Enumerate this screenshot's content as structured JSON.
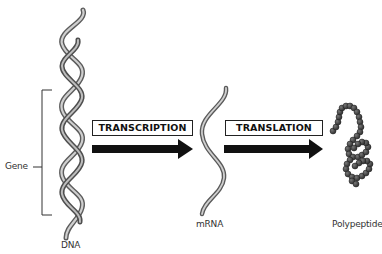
{
  "diagram": {
    "nodes": [
      {
        "id": "dna",
        "label": "DNA"
      },
      {
        "id": "mrna",
        "label": "mRNA"
      },
      {
        "id": "polypeptide",
        "label": "Polypeptide"
      }
    ],
    "edges": [
      {
        "from": "dna",
        "to": "mrna",
        "label": "TRANSCRIPTION"
      },
      {
        "from": "mrna",
        "to": "polypeptide",
        "label": "TRANSLATION"
      }
    ],
    "annotations": [
      {
        "target": "dna",
        "label": "Gene",
        "type": "bracket"
      }
    ]
  },
  "labels": {
    "gene": "Gene",
    "dna": "DNA",
    "mrna": "mRNA",
    "polypeptide": "Polypeptide",
    "transcription": "TRANSCRIPTION",
    "translation": "TRANSLATION"
  },
  "colors": {
    "strand_light": "#c8c8c8",
    "strand_dark": "#5a5a5a",
    "arrow": "#111111",
    "bead": "#3a3a3a"
  }
}
